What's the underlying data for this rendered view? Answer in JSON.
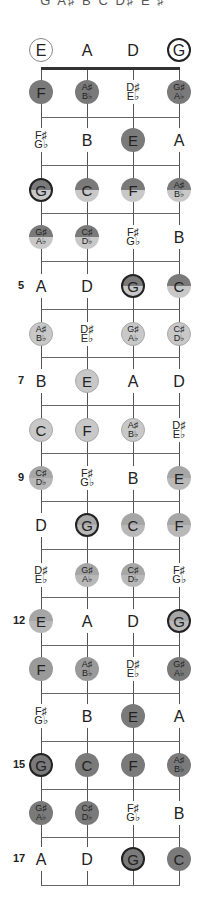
{
  "title": "G A♯ B C D♯ E ♯",
  "strings": [
    "E",
    "A",
    "D",
    "G"
  ],
  "string_x": [
    41,
    87,
    133,
    179
  ],
  "nut_y": 68,
  "open_row_y": 50,
  "fret_line_y": [
    117,
    165,
    213,
    261,
    309,
    357,
    405,
    453,
    501,
    549,
    597,
    645,
    693,
    741,
    789,
    837,
    885
  ],
  "colors": {
    "dark": "#7a7a7a",
    "mid": "#9a9a9a",
    "light": "#c8c8c8",
    "root_border": "#222222"
  },
  "open": [
    {
      "label": "E",
      "style": "open-e"
    },
    {
      "label": "A",
      "style": "plain-text"
    },
    {
      "label": "D",
      "style": "plain-text"
    },
    {
      "label": "G",
      "style": "open-g"
    }
  ],
  "frets": [
    {
      "num": "",
      "y": 92,
      "notes": [
        {
          "n": "F",
          "s": "",
          "style": "c-dark"
        },
        {
          "n": "A♯",
          "s": "B♭",
          "style": "c-dark"
        },
        {
          "n": "D♯",
          "s": "E♭",
          "style": "plain"
        },
        {
          "n": "G♯",
          "s": "A♭",
          "style": "c-dark"
        }
      ]
    },
    {
      "num": "",
      "y": 140,
      "notes": [
        {
          "n": "F♯",
          "s": "G♭",
          "style": "plain"
        },
        {
          "n": "B",
          "s": "",
          "style": "plain"
        },
        {
          "n": "E",
          "s": "",
          "style": "c-dark"
        },
        {
          "n": "A",
          "s": "",
          "style": "plain"
        }
      ]
    },
    {
      "num": "",
      "y": 190,
      "notes": [
        {
          "n": "G",
          "s": "",
          "style": "c-split root"
        },
        {
          "n": "C",
          "s": "",
          "style": "c-split"
        },
        {
          "n": "F",
          "s": "",
          "style": "c-split"
        },
        {
          "n": "A♯",
          "s": "B♭",
          "style": "c-split"
        }
      ]
    },
    {
      "num": "",
      "y": 237,
      "notes": [
        {
          "n": "G♯",
          "s": "A♭",
          "style": "c-split"
        },
        {
          "n": "C♯",
          "s": "D♭",
          "style": "c-split"
        },
        {
          "n": "F♯",
          "s": "G♭",
          "style": "plain"
        },
        {
          "n": "B",
          "s": "",
          "style": "plain"
        }
      ]
    },
    {
      "num": "5",
      "y": 286,
      "notes": [
        {
          "n": "A",
          "s": "",
          "style": "plain"
        },
        {
          "n": "D",
          "s": "",
          "style": "plain"
        },
        {
          "n": "G",
          "s": "",
          "style": "c-split root"
        },
        {
          "n": "C",
          "s": "",
          "style": "c-split"
        }
      ]
    },
    {
      "num": "",
      "y": 334,
      "notes": [
        {
          "n": "A♯",
          "s": "B♭",
          "style": "c-light"
        },
        {
          "n": "D♯",
          "s": "E♭",
          "style": "plain"
        },
        {
          "n": "G♯",
          "s": "A♭",
          "style": "c-light"
        },
        {
          "n": "C♯",
          "s": "D♭",
          "style": "c-light"
        }
      ]
    },
    {
      "num": "7",
      "y": 381,
      "notes": [
        {
          "n": "B",
          "s": "",
          "style": "plain"
        },
        {
          "n": "E",
          "s": "",
          "style": "c-light"
        },
        {
          "n": "A",
          "s": "",
          "style": "plain"
        },
        {
          "n": "D",
          "s": "",
          "style": "plain"
        }
      ]
    },
    {
      "num": "",
      "y": 430,
      "notes": [
        {
          "n": "C",
          "s": "",
          "style": "c-light"
        },
        {
          "n": "F",
          "s": "",
          "style": "c-light"
        },
        {
          "n": "A♯",
          "s": "B♭",
          "style": "c-light"
        },
        {
          "n": "D♯",
          "s": "E♭",
          "style": "plain"
        }
      ]
    },
    {
      "num": "9",
      "y": 478,
      "notes": [
        {
          "n": "C♯",
          "s": "D♭",
          "style": "c-split2"
        },
        {
          "n": "F♯",
          "s": "G♭",
          "style": "plain"
        },
        {
          "n": "B",
          "s": "",
          "style": "plain"
        },
        {
          "n": "E",
          "s": "",
          "style": "c-split2"
        }
      ]
    },
    {
      "num": "",
      "y": 525,
      "notes": [
        {
          "n": "D",
          "s": "",
          "style": "plain"
        },
        {
          "n": "G",
          "s": "",
          "style": "c-split2 root"
        },
        {
          "n": "C",
          "s": "",
          "style": "c-split2"
        },
        {
          "n": "F",
          "s": "",
          "style": "c-split2"
        }
      ]
    },
    {
      "num": "",
      "y": 575,
      "notes": [
        {
          "n": "D♯",
          "s": "E♭",
          "style": "plain"
        },
        {
          "n": "G♯",
          "s": "A♭",
          "style": "c-split2"
        },
        {
          "n": "C♯",
          "s": "D♭",
          "style": "c-split2"
        },
        {
          "n": "F♯",
          "s": "G♭",
          "style": "plain"
        }
      ]
    },
    {
      "num": "12",
      "y": 621,
      "notes": [
        {
          "n": "E",
          "s": "",
          "style": "c-split2"
        },
        {
          "n": "A",
          "s": "",
          "style": "plain"
        },
        {
          "n": "D",
          "s": "",
          "style": "plain"
        },
        {
          "n": "G",
          "s": "",
          "style": "c-split2 root"
        }
      ]
    },
    {
      "num": "",
      "y": 669,
      "notes": [
        {
          "n": "F",
          "s": "",
          "style": "c-mid"
        },
        {
          "n": "A♯",
          "s": "B♭",
          "style": "c-mid"
        },
        {
          "n": "D♯",
          "s": "E♭",
          "style": "plain"
        },
        {
          "n": "G♯",
          "s": "A♭",
          "style": "c-dark"
        }
      ]
    },
    {
      "num": "",
      "y": 716,
      "notes": [
        {
          "n": "F♯",
          "s": "G♭",
          "style": "plain"
        },
        {
          "n": "B",
          "s": "",
          "style": "plain"
        },
        {
          "n": "E",
          "s": "",
          "style": "c-dark"
        },
        {
          "n": "A",
          "s": "",
          "style": "plain"
        }
      ]
    },
    {
      "num": "15",
      "y": 765,
      "notes": [
        {
          "n": "G",
          "s": "",
          "style": "c-dark root"
        },
        {
          "n": "C",
          "s": "",
          "style": "c-dark"
        },
        {
          "n": "F",
          "s": "",
          "style": "c-dark"
        },
        {
          "n": "A♯",
          "s": "B♭",
          "style": "c-dark"
        }
      ]
    },
    {
      "num": "",
      "y": 813,
      "notes": [
        {
          "n": "G♯",
          "s": "A♭",
          "style": "c-dark"
        },
        {
          "n": "C♯",
          "s": "D♭",
          "style": "c-dark"
        },
        {
          "n": "F♯",
          "s": "G♭",
          "style": "plain"
        },
        {
          "n": "B",
          "s": "",
          "style": "plain"
        }
      ]
    },
    {
      "num": "17",
      "y": 859,
      "notes": [
        {
          "n": "A",
          "s": "",
          "style": "plain"
        },
        {
          "n": "D",
          "s": "",
          "style": "plain"
        },
        {
          "n": "G",
          "s": "",
          "style": "c-dark root"
        },
        {
          "n": "C",
          "s": "",
          "style": "c-dark"
        }
      ]
    }
  ]
}
